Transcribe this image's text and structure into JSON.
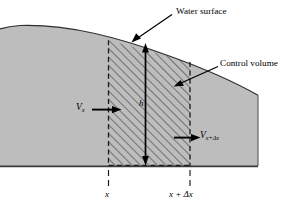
{
  "figure": {
    "type": "open-channel-flow-control-volume-diagram",
    "background_color": "#ffffff",
    "water_body_color": "#bdbdbd",
    "outline_color": "#000000"
  },
  "labels": {
    "water_surface": "Water surface",
    "control_volume": "Control volume",
    "velocity_in": "V",
    "velocity_in_subscript": "x",
    "velocity_out": "V",
    "velocity_out_subscript": "x+Δx",
    "depth": "h",
    "axis_left": "x",
    "axis_right": "x + Δx"
  },
  "geometry": {
    "control_volume_left_x": 108,
    "control_volume_right_x": 190,
    "bed_y": 166,
    "water_body_right_x": 258
  }
}
